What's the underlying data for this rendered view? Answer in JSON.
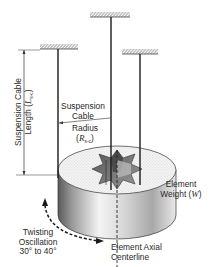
{
  "diagram": {
    "type": "torsional pendulum suspension setup",
    "labels": {
      "cable_length": {
        "line1": "Suspension Cable",
        "line2_prefix": "Length (",
        "symbol": "L",
        "subscript": "s-c",
        "line2_suffix": ")"
      },
      "suspension_cable": {
        "line1": "Suspension",
        "line2": "Cable"
      },
      "radius": {
        "line1": "Radius",
        "prefix": "(",
        "symbol": "R",
        "subscript": "s-c",
        "suffix": ")"
      },
      "element_weight": {
        "line1": "Element",
        "line2_prefix": "Weight (",
        "symbol": "W",
        "line2_suffix": ")"
      },
      "twisting": {
        "line1": "Twisting",
        "line2": "Oscillation",
        "line3": "30° to 40°"
      },
      "centerline": {
        "line1": "Element Axial",
        "line2": "Centerline"
      }
    },
    "colors": {
      "line": "#1a1a1a",
      "hatch": "#777777",
      "text": "#2a2a2a",
      "cylinder_light": "#f2f2f2",
      "cylinder_dark": "#6a6a6a"
    }
  }
}
